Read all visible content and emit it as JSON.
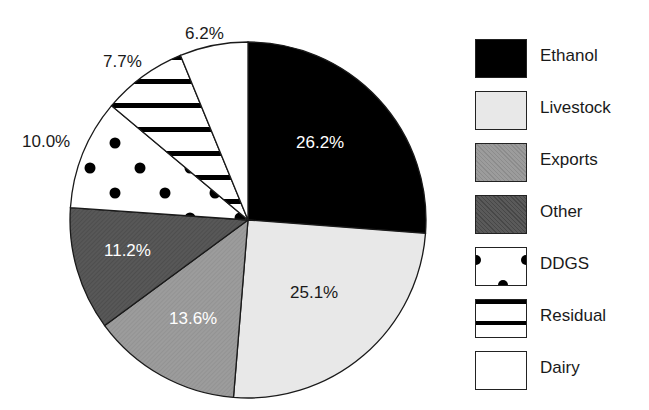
{
  "chart_data": {
    "type": "pie",
    "title": "",
    "start_angle_deg": 0,
    "direction": "clockwise",
    "categories": [
      "Ethanol",
      "Livestock",
      "Exports",
      "Other",
      "DDGS",
      "Residual",
      "Dairy"
    ],
    "values": [
      26.2,
      25.1,
      13.6,
      11.2,
      10.0,
      7.7,
      6.2
    ],
    "labels": [
      "26.2%",
      "25.1%",
      "13.6%",
      "11.2%",
      "10.0%",
      "7.7%",
      "6.2%"
    ],
    "fills": [
      "solid black",
      "light gray",
      "medium gray hatched",
      "dark gray hatched",
      "white with black dots",
      "white with black horizontal stripes",
      "white"
    ],
    "colors": [
      "#000000",
      "#e6e6e6",
      "#9a9a9a",
      "#555555",
      "#ffffff",
      "#ffffff",
      "#ffffff"
    ],
    "label_colors": [
      "#ffffff",
      "#1a1a1a",
      "#ffffff",
      "#ffffff",
      "#1a1a1a",
      "#1a1a1a",
      "#1a1a1a"
    ],
    "legend_position": "right"
  },
  "legend": {
    "items": [
      {
        "label": "Ethanol"
      },
      {
        "label": "Livestock"
      },
      {
        "label": "Exports"
      },
      {
        "label": "Other"
      },
      {
        "label": "DDGS"
      },
      {
        "label": "Residual"
      },
      {
        "label": "Dairy"
      }
    ]
  },
  "slice_labels": {
    "ethanol": "26.2%",
    "livestock": "25.1%",
    "exports": "13.6%",
    "other": "11.2%",
    "ddgs": "10.0%",
    "residual": "7.7%",
    "dairy": "6.2%"
  }
}
